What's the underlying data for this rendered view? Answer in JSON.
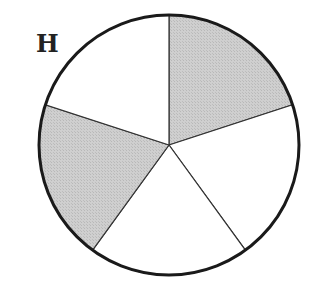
{
  "figure": {
    "label": "H"
  },
  "diagram": {
    "type": "circle-divided-into-equal-parts",
    "total_parts": 5,
    "shaded_parts": 2,
    "colors": {
      "shaded": "#c8c8c8",
      "unshaded": "#ffffff",
      "outline": "#1a1a1a"
    },
    "slices": [
      {
        "index": 0,
        "position": "upper-right",
        "shaded": true
      },
      {
        "index": 1,
        "position": "right",
        "shaded": false
      },
      {
        "index": 2,
        "position": "bottom",
        "shaded": false
      },
      {
        "index": 3,
        "position": "left",
        "shaded": true
      },
      {
        "index": 4,
        "position": "upper-left",
        "shaded": false
      }
    ]
  }
}
